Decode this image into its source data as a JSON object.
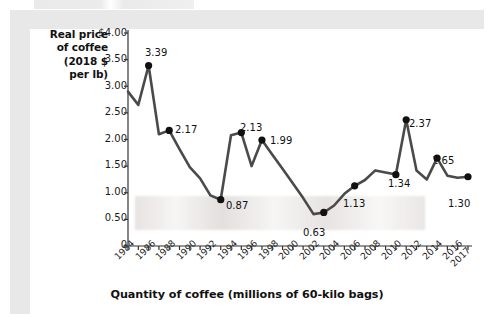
{
  "figure": {
    "background_color": "#ffffff",
    "frame_color": "#e8e8e8",
    "line_color": "#4a4a4a",
    "marker_color": "#111111"
  },
  "axes": {
    "y_axis_title_lines": [
      "Real price",
      "of coffee",
      "(2018 $",
      "per lb)"
    ],
    "x_axis_title": "Quantity of coffee (millions of 60-kilo bags)",
    "y_ticks": [
      "$4.00",
      "3.50",
      "3.00",
      "2.50",
      "2.00",
      "1.50",
      "1.00",
      "0.50",
      "0"
    ],
    "x_ticks": [
      "1984",
      "1986",
      "1988",
      "1990",
      "1992",
      "1994",
      "1996",
      "1998",
      "2000",
      "2002",
      "2004",
      "2006",
      "2008",
      "2010",
      "2012",
      "2014",
      "2016",
      "2017"
    ]
  },
  "chart_data": {
    "type": "line",
    "title": "",
    "xlabel": "Quantity of coffee (millions of 60-kilo bags)",
    "ylabel": "Real price of coffee (2018 $ per lb)",
    "xlim": [
      1984,
      2017
    ],
    "ylim": [
      0,
      4.0
    ],
    "ytick_values": [
      0,
      0.5,
      1.0,
      1.5,
      2.0,
      2.5,
      3.0,
      3.5,
      4.0
    ],
    "grid": false,
    "legend": "none",
    "x": [
      1984,
      1985,
      1986,
      1987,
      1988,
      1989,
      1990,
      1991,
      1992,
      1993,
      1994,
      1995,
      1996,
      1997,
      1998,
      1999,
      2000,
      2001,
      2002,
      2003,
      2004,
      2005,
      2006,
      2007,
      2008,
      2009,
      2010,
      2011,
      2012,
      2013,
      2014,
      2015,
      2016,
      2017
    ],
    "values": [
      2.9,
      2.65,
      3.39,
      2.1,
      2.17,
      1.82,
      1.48,
      1.27,
      0.95,
      0.87,
      2.08,
      2.13,
      1.5,
      1.99,
      1.72,
      1.45,
      1.18,
      0.9,
      0.6,
      0.63,
      0.76,
      0.98,
      1.13,
      1.24,
      1.42,
      1.38,
      1.34,
      2.37,
      1.42,
      1.25,
      1.65,
      1.32,
      1.28,
      1.3
    ],
    "labeled_points": [
      {
        "x": 1986,
        "value": 3.39,
        "label": "3.39"
      },
      {
        "x": 1988,
        "value": 2.17,
        "label": "2.17"
      },
      {
        "x": 1993,
        "value": 0.87,
        "label": "0.87"
      },
      {
        "x": 1995,
        "value": 2.13,
        "label": "2.13"
      },
      {
        "x": 1997,
        "value": 1.99,
        "label": "1.99"
      },
      {
        "x": 2003,
        "value": 0.63,
        "label": "0.63"
      },
      {
        "x": 2006,
        "value": 1.13,
        "label": "1.13"
      },
      {
        "x": 2010,
        "value": 1.34,
        "label": "1.34"
      },
      {
        "x": 2011,
        "value": 2.37,
        "label": "2.37"
      },
      {
        "x": 2014,
        "value": 1.65,
        "label": "1.65"
      },
      {
        "x": 2017,
        "value": 1.3,
        "label": "1.30"
      }
    ]
  },
  "point_labels": {
    "p1986": "3.39",
    "p1988": "2.17",
    "p1993": "0.87",
    "p1995": "2.13",
    "p1997": "1.99",
    "p2003": "0.63",
    "p2006": "1.13",
    "p2010": "1.34",
    "p2011": "2.37",
    "p2014": "1.65",
    "p2017": "1.30"
  }
}
